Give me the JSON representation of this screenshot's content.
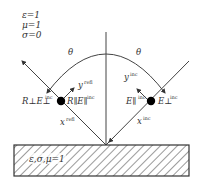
{
  "diagram": {
    "type": "oblique-incidence-reflection",
    "colors": {
      "line": "#444444",
      "hatch": "#555555",
      "text": "#333333",
      "dot": "#000000"
    },
    "upper_medium": {
      "params": [
        "ε=1",
        "μ=1",
        "σ=0"
      ]
    },
    "lower_medium": {
      "label": "ε,σ,μ=1"
    },
    "angles": {
      "left": "θ",
      "right": "θ"
    },
    "reflected_side": {
      "field_perp": "R⊥E⊥",
      "field_perp_sup": "inc",
      "field_par": "R∥E∥",
      "field_par_sup": "inc",
      "y_vec": "y",
      "y_vec_sup": "refl",
      "x_vec": "x",
      "x_vec_sup": "refl"
    },
    "incident_side": {
      "field_par": "E∥",
      "field_par_sup": "inc",
      "field_perp": "E⊥",
      "field_perp_sup": "inc",
      "y_vec": "y",
      "y_vec_sup": "inc",
      "x_vec": "x",
      "x_vec_sup": "inc"
    }
  }
}
